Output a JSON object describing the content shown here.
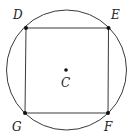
{
  "diagram": {
    "type": "square-inscribed-in-circle",
    "center": {
      "label": "C"
    },
    "vertices": [
      {
        "id": "D",
        "label": "D",
        "position": "top-left"
      },
      {
        "id": "E",
        "label": "E",
        "position": "top-right"
      },
      {
        "id": "F",
        "label": "F",
        "position": "bottom-right"
      },
      {
        "id": "G",
        "label": "G",
        "position": "bottom-left"
      }
    ],
    "colors": {
      "stroke": "#3a3a3a",
      "point": "#111111"
    }
  }
}
